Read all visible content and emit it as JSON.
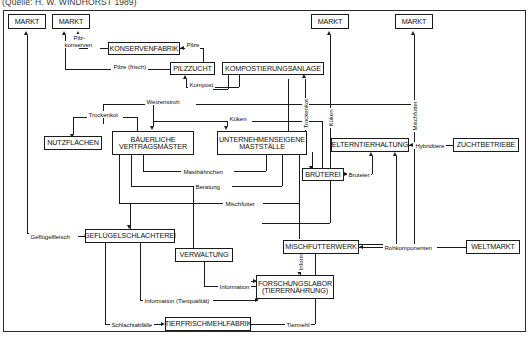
{
  "caption": "(Quelle: H. W. WINDHORST 1989)",
  "diagram": {
    "type": "flow-diagram",
    "language": "de",
    "nodes": [
      {
        "id": "markt1",
        "label": "MARKT",
        "x": 8,
        "y": 14,
        "w": 38,
        "h": 15
      },
      {
        "id": "markt2",
        "label": "MARKT",
        "x": 52,
        "y": 14,
        "w": 38,
        "h": 15
      },
      {
        "id": "markt3",
        "label": "MARKT",
        "x": 311,
        "y": 14,
        "w": 38,
        "h": 15
      },
      {
        "id": "markt4",
        "label": "MARKT",
        "x": 395,
        "y": 14,
        "w": 38,
        "h": 15
      },
      {
        "id": "konserv",
        "label": "KONSERVENFABRIK",
        "x": 108,
        "y": 42,
        "w": 72,
        "h": 13
      },
      {
        "id": "pilz",
        "label": "PILZZUCHT",
        "x": 170,
        "y": 62,
        "w": 45,
        "h": 13
      },
      {
        "id": "kompost",
        "label": "KOMPOSTIERUNGSANLAGE",
        "x": 222,
        "y": 62,
        "w": 102,
        "h": 13
      },
      {
        "id": "nutz",
        "label": "NUTZFLÄCHEN",
        "x": 44,
        "y": 136,
        "w": 58,
        "h": 14
      },
      {
        "id": "bauer",
        "label1": "BÄUERLICHE",
        "label2": "VERTRAGSMÄSTER",
        "x": 112,
        "y": 131,
        "w": 82,
        "h": 24
      },
      {
        "id": "untern",
        "label1": "UNTERNEHMENSEIGENE",
        "label2": "MASTSTÄLLE",
        "x": 217,
        "y": 131,
        "w": 90,
        "h": 24
      },
      {
        "id": "eltern",
        "label": "ELTERNTIERHALTUNG",
        "x": 331,
        "y": 138,
        "w": 78,
        "h": 14
      },
      {
        "id": "zucht",
        "label": "ZUCHTBETRIEBE",
        "x": 453,
        "y": 138,
        "w": 66,
        "h": 14
      },
      {
        "id": "brut",
        "label": "BRÜTEREI",
        "x": 302,
        "y": 168,
        "w": 42,
        "h": 13
      },
      {
        "id": "gefluegel",
        "label": "GEFLÜGELSCHLACHTEREI",
        "x": 85,
        "y": 229,
        "w": 90,
        "h": 14
      },
      {
        "id": "misch",
        "label": "MISCHFUTTERWERK",
        "x": 283,
        "y": 240,
        "w": 76,
        "h": 14
      },
      {
        "id": "weltmarkt",
        "label": "WELTMARKT",
        "x": 466,
        "y": 240,
        "w": 54,
        "h": 14
      },
      {
        "id": "verwalt",
        "label": "VERWALTUNG",
        "x": 175,
        "y": 248,
        "w": 58,
        "h": 14
      },
      {
        "id": "forsch",
        "label1": "FORSCHUNGSLABOR",
        "label2": "(TIERERNÄHRUNG)",
        "x": 256,
        "y": 275,
        "w": 78,
        "h": 24
      },
      {
        "id": "tierfrisch",
        "label": "TIERFRISCHMEHLFABRIK",
        "x": 165,
        "y": 317,
        "w": 86,
        "h": 14
      }
    ],
    "edge_labels": [
      {
        "id": "pilzkons",
        "text": "Pilz-",
        "x": 72,
        "y": 37
      },
      {
        "id": "pilzkons2",
        "text": "konserven",
        "x": 64,
        "y": 44
      },
      {
        "id": "pilze",
        "text": "Pilze",
        "x": 185,
        "y": 44
      },
      {
        "id": "pilzefrisch",
        "text": "Pilze (frisch)",
        "x": 113,
        "y": 66
      },
      {
        "id": "kompost_l",
        "text": "Kompost",
        "x": 188,
        "y": 83
      },
      {
        "id": "weizenstroh",
        "text": "Weizenstroh",
        "x": 147,
        "y": 100
      },
      {
        "id": "trockenkot",
        "text": "Trockenkot",
        "x": 90,
        "y": 113
      },
      {
        "id": "trockenkot2",
        "text": "Trockenkot",
        "x": 299,
        "y": 100,
        "vertical": true
      },
      {
        "id": "kuekenA",
        "text": "Küken",
        "x": 229,
        "y": 118
      },
      {
        "id": "kuekenB",
        "text": "Küken",
        "x": 318,
        "y": 100,
        "vertical": true
      },
      {
        "id": "mischfutterV",
        "text": "Mischfutter",
        "x": 406,
        "y": 95,
        "vertical": true
      },
      {
        "id": "hybrid",
        "text": "Hybridtiere",
        "x": 415,
        "y": 142
      },
      {
        "id": "masthaehn",
        "text": "Masthähnchen",
        "x": 188,
        "y": 168
      },
      {
        "id": "beratung",
        "text": "Beratung",
        "x": 200,
        "y": 183
      },
      {
        "id": "bruteier",
        "text": "Bruteier",
        "x": 348,
        "y": 171
      },
      {
        "id": "mischfutterH",
        "text": "Mischfutter",
        "x": 230,
        "y": 200
      },
      {
        "id": "gefluegelfl",
        "text": "Geflügelfleisch",
        "x": 29,
        "y": 232
      },
      {
        "id": "rohkomp",
        "text": "Rohkomponenten",
        "x": 386,
        "y": 243
      },
      {
        "id": "infoV",
        "text": "Information",
        "x": 296,
        "y": 232,
        "vertical": true
      },
      {
        "id": "info",
        "text": "Information",
        "x": 222,
        "y": 283
      },
      {
        "id": "infotier",
        "text": "Information (Tierqualität)",
        "x": 145,
        "y": 297
      },
      {
        "id": "schlachtab",
        "text": "Schlachtabfälle",
        "x": 112,
        "y": 321
      },
      {
        "id": "tiermehl",
        "text": "Tiermehl",
        "x": 289,
        "y": 321
      }
    ]
  }
}
